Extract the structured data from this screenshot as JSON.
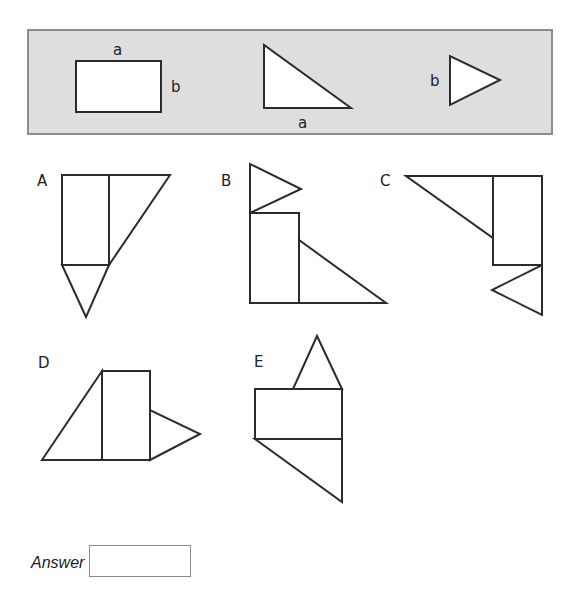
{
  "reference_panel": {
    "pieces": [
      {
        "name": "rectangle",
        "labels": {
          "top": "a",
          "right": "b"
        }
      },
      {
        "name": "right-triangle",
        "labels": {
          "bottom": "a"
        }
      },
      {
        "name": "isosceles-triangle",
        "labels": {
          "left": "b"
        }
      }
    ],
    "colors": {
      "fill": "#dedede",
      "border": "#8c8c8c"
    }
  },
  "options": [
    {
      "label": "A"
    },
    {
      "label": "B"
    },
    {
      "label": "C"
    },
    {
      "label": "D"
    },
    {
      "label": "E"
    }
  ],
  "answer": {
    "label": "Answer",
    "value": "",
    "placeholder": ""
  }
}
